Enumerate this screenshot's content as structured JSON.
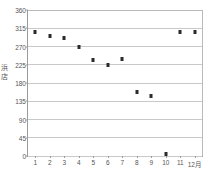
{
  "chart_data": {
    "type": "scatter",
    "title": "",
    "xlabel": "",
    "ylabel": "浜店",
    "categories": [
      "1",
      "2",
      "3",
      "4",
      "5",
      "6",
      "7",
      "8",
      "9",
      "10",
      "11",
      "12月"
    ],
    "x": [
      1,
      2,
      3,
      4,
      5,
      6,
      7,
      8,
      9,
      10,
      11,
      12
    ],
    "values": [
      306,
      297,
      292,
      270,
      236,
      224,
      238,
      157,
      149,
      4,
      306,
      305
    ],
    "series": [
      {
        "name": "浜店",
        "values": [
          306,
          297,
          292,
          270,
          236,
          224,
          238,
          157,
          149,
          4,
          306,
          305
        ]
      }
    ],
    "ylim": [
      0,
      360
    ],
    "yticks": [
      0,
      45,
      90,
      135,
      180,
      225,
      270,
      315,
      360
    ],
    "ytick_labels": [
      "0",
      "45",
      "90",
      "135",
      "180",
      "225",
      "270",
      "315",
      "360"
    ],
    "xlim": [
      0.5,
      12.5
    ],
    "grid": true,
    "grid_axis": "y",
    "legend": false,
    "legend_position": "none",
    "marker": "square",
    "marker_color": "#2b2b2b"
  },
  "axes": {
    "y_title_chars": "浜\n店"
  }
}
